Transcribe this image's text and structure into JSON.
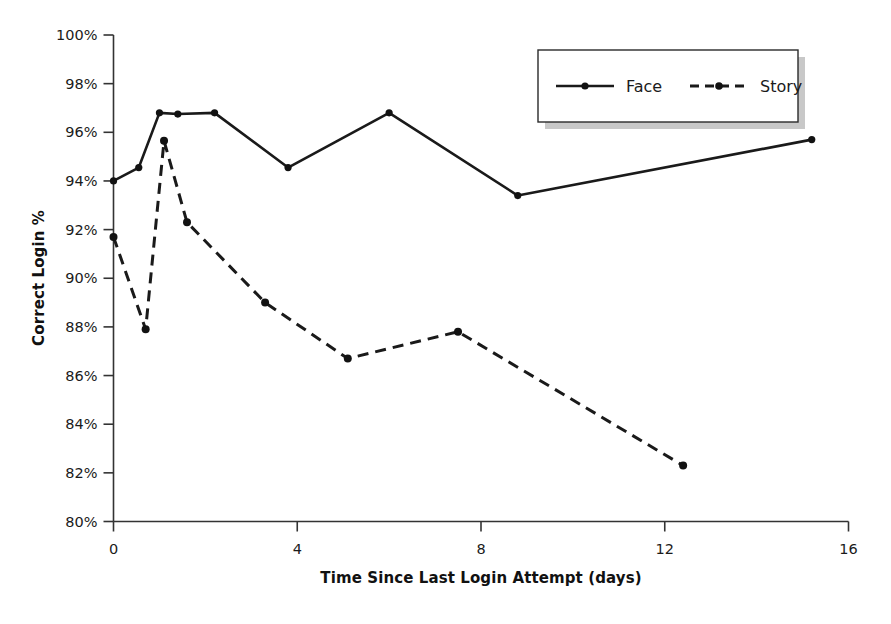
{
  "chart_data": {
    "type": "line",
    "title": "",
    "xlabel": "Time Since Last Login Attempt (days)",
    "ylabel": "Correct Login %",
    "xlim": [
      0,
      16
    ],
    "ylim": [
      80,
      100
    ],
    "xticks": [
      "0",
      "4",
      "8",
      "12",
      "16"
    ],
    "xtick_values": [
      0,
      4,
      8,
      12,
      16
    ],
    "yticks": [
      "80%",
      "82%",
      "84%",
      "86%",
      "88%",
      "90%",
      "92%",
      "94%",
      "96%",
      "98%",
      "100%"
    ],
    "ytick_values": [
      80,
      82,
      84,
      86,
      88,
      90,
      92,
      94,
      96,
      98,
      100
    ],
    "grid": false,
    "legend_position": "top-right",
    "series": [
      {
        "name": "Face",
        "style": "solid",
        "marker": "circle",
        "color": "#1a1a1a",
        "x": [
          0.0,
          0.55,
          1.0,
          1.4,
          2.2,
          3.8,
          6.0,
          8.8,
          15.2
        ],
        "y": [
          94.0,
          94.55,
          96.8,
          96.75,
          96.8,
          94.55,
          96.8,
          93.4,
          95.7
        ]
      },
      {
        "name": "Story",
        "style": "dashed",
        "marker": "circle",
        "color": "#1a1a1a",
        "x": [
          0.0,
          0.7,
          1.1,
          1.6,
          3.3,
          5.1,
          7.5,
          12.4
        ],
        "y": [
          91.7,
          87.9,
          95.65,
          92.3,
          89.0,
          86.7,
          87.8,
          82.3
        ]
      }
    ]
  },
  "legend": {
    "entries": [
      {
        "label": "Face"
      },
      {
        "label": "Story"
      }
    ]
  },
  "colors": {
    "ink": "#1a1a1a",
    "axis": "#333333",
    "background": "#ffffff"
  }
}
